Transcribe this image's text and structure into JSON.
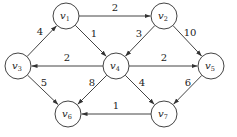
{
  "diagram": {
    "type": "weighted directed graph",
    "nodes": [
      {
        "id": "v1",
        "label": "v",
        "sub": "1",
        "x": 66,
        "y": 16
      },
      {
        "id": "v2",
        "label": "v",
        "sub": "2",
        "x": 164,
        "y": 16
      },
      {
        "id": "v3",
        "label": "v",
        "sub": "3",
        "x": 18,
        "y": 66
      },
      {
        "id": "v4",
        "label": "v",
        "sub": "4",
        "x": 116,
        "y": 66
      },
      {
        "id": "v5",
        "label": "v",
        "sub": "5",
        "x": 211,
        "y": 66
      },
      {
        "id": "v6",
        "label": "v",
        "sub": "6",
        "x": 68,
        "y": 114
      },
      {
        "id": "v7",
        "label": "v",
        "sub": "7",
        "x": 164,
        "y": 114
      }
    ],
    "edges": [
      {
        "from": "v1",
        "to": "v2",
        "weight": "2",
        "lx": 115,
        "ly": 11
      },
      {
        "from": "v1",
        "to": "v4",
        "weight": "1",
        "lx": 94,
        "ly": 37
      },
      {
        "from": "v3",
        "to": "v1",
        "weight": "4",
        "lx": 40,
        "ly": 35
      },
      {
        "from": "v2",
        "to": "v4",
        "weight": "3",
        "lx": 139,
        "ly": 37
      },
      {
        "from": "v2",
        "to": "v5",
        "weight": "10",
        "lx": 190,
        "ly": 36
      },
      {
        "from": "v4",
        "to": "v3",
        "weight": "2",
        "lx": 67,
        "ly": 61
      },
      {
        "from": "v4",
        "to": "v5",
        "weight": "2",
        "lx": 164,
        "ly": 61
      },
      {
        "from": "v3",
        "to": "v6",
        "weight": "5",
        "lx": 44,
        "ly": 86
      },
      {
        "from": "v4",
        "to": "v6",
        "weight": "8",
        "lx": 92,
        "ly": 86
      },
      {
        "from": "v4",
        "to": "v7",
        "weight": "4",
        "lx": 142,
        "ly": 86
      },
      {
        "from": "v5",
        "to": "v7",
        "weight": "6",
        "lx": 188,
        "ly": 86
      },
      {
        "from": "v7",
        "to": "v6",
        "weight": "1",
        "lx": 116,
        "ly": 109
      }
    ]
  }
}
